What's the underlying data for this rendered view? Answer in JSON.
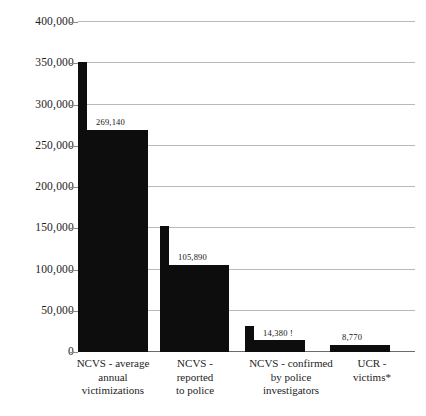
{
  "chart_data": {
    "type": "bar",
    "title": "",
    "subtitle": "",
    "xlabel": "",
    "ylabel": "",
    "ylim": [
      0,
      400000
    ],
    "grid": true,
    "legend": false,
    "legend_position": "none",
    "categories": [
      "NCVS - average\nannual\nvictimizations",
      "NCVS -\nreported\nto police",
      "NCVS - confirmed\nby police\ninvestigators",
      "UCR -\nvictims*"
    ],
    "values": [
      269140,
      105890,
      14380,
      8770
    ],
    "data_labels": [
      "269,140",
      "105,890",
      "14,380 !",
      "8,770"
    ],
    "upper_markers": [
      351000,
      153000,
      32000,
      null
    ],
    "ytick_values": [
      0,
      50000,
      100000,
      150000,
      200000,
      250000,
      300000,
      350000,
      400000
    ],
    "ytick_labels": [
      "0",
      "50,000",
      "100,000",
      "150,000",
      "200,000",
      "250,000",
      "300,000",
      "350,000",
      "400,000"
    ],
    "series": [
      {
        "name": "count",
        "values": [
          269140,
          105890,
          14380,
          8770
        ]
      }
    ],
    "footnote": "*"
  },
  "colors": {
    "bar": "#0d0d0d",
    "gridline": "#b9b9b9",
    "axis": "#6b6b6b",
    "text": "#1d1d1d",
    "background": "#ffffff"
  }
}
